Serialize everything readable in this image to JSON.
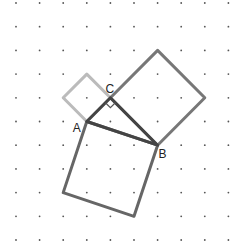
{
  "figure": {
    "title": "",
    "grid": {
      "cols": 10,
      "rows": 11,
      "origin_x": 16,
      "origin_y": 3,
      "spacing_x": 23.6,
      "spacing_y": 23.7,
      "dot_color": "#555555"
    },
    "labels": {
      "A": "A",
      "B": "B",
      "C": "C"
    },
    "points": {
      "A": [
        3,
        5
      ],
      "B": [
        6,
        6
      ],
      "C": [
        4,
        4
      ]
    },
    "squares": [
      {
        "name": "square-on-AC",
        "vertices": [
          [
            3,
            5
          ],
          [
            4,
            4
          ],
          [
            3,
            3
          ],
          [
            2,
            4
          ]
        ],
        "color": "#bbbbbb"
      },
      {
        "name": "square-on-CB",
        "vertices": [
          [
            4,
            4
          ],
          [
            6,
            6
          ],
          [
            8,
            4
          ],
          [
            6,
            2
          ]
        ],
        "color": "#777777"
      },
      {
        "name": "square-on-AB",
        "vertices": [
          [
            3,
            5
          ],
          [
            6,
            6
          ],
          [
            5,
            9
          ],
          [
            2,
            8
          ]
        ],
        "color": "#666666"
      }
    ],
    "triangle": {
      "vertices": [
        [
          3,
          5
        ],
        [
          6,
          6
        ],
        [
          4,
          4
        ]
      ],
      "color": "#444444"
    },
    "right_angle_marker": "C"
  }
}
